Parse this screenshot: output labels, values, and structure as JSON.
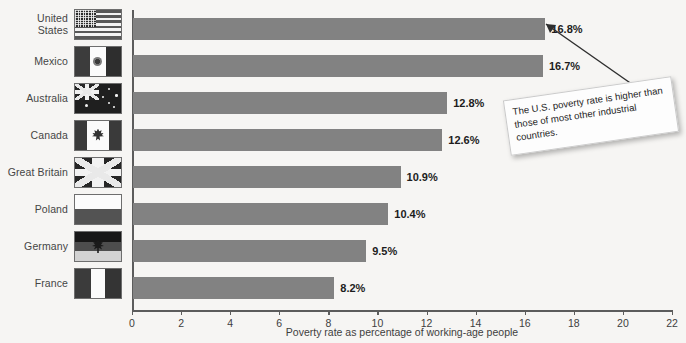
{
  "chart_data": {
    "type": "bar",
    "orientation": "horizontal",
    "title": "",
    "xlabel": "Poverty rate as percentage of working-age people",
    "ylabel": "",
    "xlim": [
      0,
      22
    ],
    "xticks": [
      0,
      2,
      4,
      6,
      8,
      10,
      12,
      14,
      16,
      18,
      20,
      22
    ],
    "grid": false,
    "legend": "none",
    "categories": [
      "United States",
      "Mexico",
      "Australia",
      "Canada",
      "Great Britain",
      "Poland",
      "Germany",
      "France"
    ],
    "values": [
      16.8,
      16.7,
      12.8,
      12.6,
      10.9,
      10.4,
      9.5,
      8.2
    ],
    "value_labels": [
      "16.8%",
      "16.7%",
      "12.8%",
      "12.6%",
      "10.9%",
      "10.4%",
      "9.5%",
      "8.2%"
    ],
    "bar_color": "#828282",
    "background_color": "#f6f5f3",
    "annotations": [
      {
        "text": "The U.S. poverty rate is higher than those of most other industrial countries.",
        "points_to": "United States"
      }
    ]
  },
  "rows": [
    {
      "label_line1": "United",
      "label_line2": "States",
      "flag": "flag-united-states",
      "value_label": "16.8%"
    },
    {
      "label_line1": "Mexico",
      "label_line2": "",
      "flag": "flag-mexico",
      "value_label": "16.7%"
    },
    {
      "label_line1": "Australia",
      "label_line2": "",
      "flag": "flag-australia",
      "value_label": "12.8%"
    },
    {
      "label_line1": "Canada",
      "label_line2": "",
      "flag": "flag-canada",
      "value_label": "12.6%"
    },
    {
      "label_line1": "Great Britain",
      "label_line2": "",
      "flag": "flag-great-britain",
      "value_label": "10.9%"
    },
    {
      "label_line1": "Poland",
      "label_line2": "",
      "flag": "flag-poland",
      "value_label": "10.4%"
    },
    {
      "label_line1": "Germany",
      "label_line2": "",
      "flag": "flag-germany",
      "value_label": "9.5%"
    },
    {
      "label_line1": "France",
      "label_line2": "",
      "flag": "flag-france",
      "value_label": "8.2%"
    }
  ],
  "axis": {
    "x_title": "Poverty rate as percentage of working-age people",
    "tick_labels": [
      "0",
      "2",
      "4",
      "6",
      "8",
      "10",
      "12",
      "14",
      "16",
      "18",
      "20",
      "22"
    ]
  },
  "callout": {
    "text": "The U.S. poverty rate is higher than those of most other industrial countries."
  }
}
